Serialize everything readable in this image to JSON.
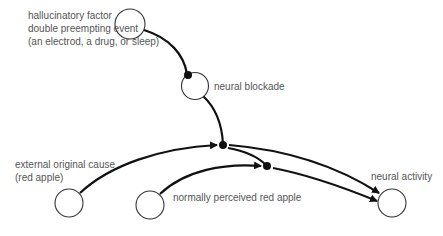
{
  "diagram": {
    "nodes": [
      {
        "id": "hallucinatory",
        "label_lines": [
          "hallucinatory factor",
          "double preempting event",
          "(an electrod, a drug, or sleep)"
        ]
      },
      {
        "id": "blockade",
        "label": "neural blockade"
      },
      {
        "id": "external",
        "label_lines": [
          "external original cause",
          "(red apple)"
        ]
      },
      {
        "id": "perceived",
        "label": "normally perceived red apple"
      },
      {
        "id": "activity",
        "label": "neural activity"
      }
    ],
    "edges": [
      {
        "from": "hallucinatory",
        "to": "blockade",
        "type": "inhibit-dot"
      },
      {
        "from": "blockade",
        "to": "junction1",
        "type": "inhibit-dot"
      },
      {
        "from": "external",
        "to": "junction1",
        "type": "arrow"
      },
      {
        "from": "junction1",
        "to": "junction2",
        "type": "inhibit-dot"
      },
      {
        "from": "perceived",
        "to": "junction2",
        "type": "arrow"
      },
      {
        "from": "junction1",
        "to": "activity",
        "type": "arrow"
      },
      {
        "from": "junction2",
        "to": "activity",
        "type": "arrow"
      }
    ],
    "colors": {
      "node_stroke": "#333333",
      "edge": "#111111",
      "label": "#555555"
    }
  }
}
